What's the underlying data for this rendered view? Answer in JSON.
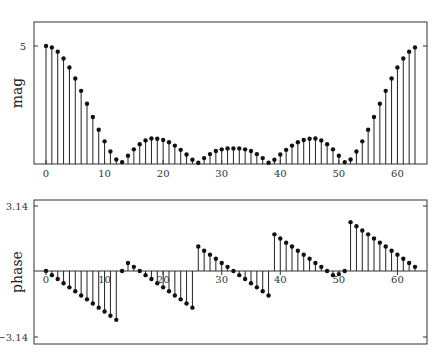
{
  "chart_data": [
    {
      "type": "stem",
      "title": "",
      "xlabel": "",
      "ylabel": "mag",
      "xlim": [
        -2,
        65
      ],
      "ylim": [
        0,
        5.5
      ],
      "xticks": [
        0,
        10,
        20,
        30,
        40,
        50,
        60
      ],
      "yticks": [
        {
          "value": 5,
          "label": "5"
        }
      ],
      "grid": false,
      "x": [
        0,
        1,
        2,
        3,
        4,
        5,
        6,
        7,
        8,
        9,
        10,
        11,
        12,
        13,
        14,
        15,
        16,
        17,
        18,
        19,
        20,
        21,
        22,
        23,
        24,
        25,
        26,
        27,
        28,
        29,
        30,
        31,
        32,
        33,
        34,
        35,
        36,
        37,
        38,
        39,
        40,
        41,
        42,
        43,
        44,
        45,
        46,
        47,
        48,
        49,
        50,
        51,
        52,
        53,
        54,
        55,
        56,
        57,
        58,
        59,
        60,
        61,
        62,
        63
      ],
      "values": [
        5.0,
        4.94,
        4.76,
        4.47,
        4.09,
        3.62,
        3.1,
        2.55,
        1.99,
        1.45,
        0.96,
        0.53,
        0.19,
        0.08,
        0.35,
        0.62,
        0.84,
        1.0,
        1.08,
        1.07,
        1.02,
        0.92,
        0.78,
        0.6,
        0.4,
        0.18,
        0.05,
        0.25,
        0.42,
        0.55,
        0.62,
        0.66,
        0.66,
        0.66,
        0.62,
        0.55,
        0.42,
        0.25,
        0.05,
        0.18,
        0.4,
        0.6,
        0.78,
        0.92,
        1.02,
        1.07,
        1.08,
        1.0,
        0.84,
        0.62,
        0.35,
        0.08,
        0.19,
        0.53,
        0.96,
        1.45,
        1.99,
        2.55,
        3.1,
        3.62,
        4.09,
        4.47,
        4.76,
        4.94
      ]
    },
    {
      "type": "stem",
      "title": "",
      "xlabel": "",
      "ylabel": "phase",
      "xlim": [
        -2,
        65
      ],
      "ylim": [
        -3.4,
        3.4
      ],
      "xticks": [
        0,
        10,
        20,
        30,
        40,
        50,
        60
      ],
      "yticks": [
        {
          "value": 3.14,
          "label": "3.14"
        },
        {
          "value": -3.14,
          "label": "−3.14"
        }
      ],
      "grid": false,
      "x": [
        0,
        1,
        2,
        3,
        4,
        5,
        6,
        7,
        8,
        9,
        10,
        11,
        12,
        13,
        14,
        15,
        16,
        17,
        18,
        19,
        20,
        21,
        22,
        23,
        24,
        25,
        26,
        27,
        28,
        29,
        30,
        31,
        32,
        33,
        34,
        35,
        36,
        37,
        38,
        39,
        40,
        41,
        42,
        43,
        44,
        45,
        46,
        47,
        48,
        49,
        50,
        51,
        52,
        53,
        54,
        55,
        56,
        57,
        58,
        59,
        60,
        61,
        62,
        63
      ],
      "values": [
        0,
        -0.2,
        -0.39,
        -0.59,
        -0.79,
        -0.98,
        -1.18,
        -1.37,
        -1.57,
        -1.77,
        -1.96,
        -2.16,
        -2.36,
        0.0,
        0.39,
        0.2,
        0.0,
        -0.2,
        -0.39,
        -0.59,
        -0.79,
        -0.98,
        -1.18,
        -1.37,
        -1.57,
        -1.77,
        1.18,
        0.98,
        0.79,
        0.59,
        0.39,
        0.2,
        0.0,
        -0.2,
        -0.39,
        -0.59,
        -0.79,
        -0.98,
        -1.18,
        1.77,
        1.57,
        1.37,
        1.18,
        0.98,
        0.79,
        0.59,
        0.39,
        0.2,
        0.0,
        -0.2,
        -0.15,
        0.0,
        2.36,
        2.16,
        1.96,
        1.77,
        1.57,
        1.37,
        1.18,
        0.98,
        0.79,
        0.59,
        0.39,
        0.2
      ]
    }
  ],
  "plots": {
    "top": {
      "ylabel": "mag",
      "ytick_label": "5"
    },
    "bottom": {
      "ylabel": "phase",
      "ytick_top": "3.14",
      "ytick_bottom": "−3.14"
    }
  },
  "xtick_labels": [
    "0",
    "10",
    "20",
    "30",
    "40",
    "50",
    "60"
  ],
  "colors": {
    "stem": "#222222",
    "frame": "#333333",
    "marker": "#111111"
  }
}
